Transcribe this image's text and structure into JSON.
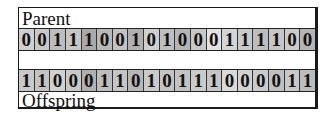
{
  "diagram": {
    "title_top": "Parent",
    "title_bottom": "Offspring",
    "parent": {
      "label": "Parent",
      "bits": [
        "0",
        "0",
        "1",
        "1",
        "1",
        "0",
        "0",
        "1",
        "0",
        "1",
        "0",
        "0",
        "0",
        "1",
        "1",
        "1",
        "1",
        "0",
        "0"
      ],
      "shades": [
        "#d0d0d0",
        "#c8c8c8",
        "#bdbdbd",
        "#c6c6c6",
        "#a9a9a9",
        "#b8b8b8",
        "#c2c2c2",
        "#b0b0b0",
        "#cfcfcf",
        "#bebebe",
        "#b5b5b5",
        "#c8c8c8",
        "#e2e2e2",
        "#d4d4d4",
        "#c9c9c9",
        "#bdbdbd",
        "#c6c6c6",
        "#cbcbcb",
        "#b4b4b4"
      ]
    },
    "offspring": {
      "label": "Offspring",
      "bits": [
        "1",
        "1",
        "0",
        "0",
        "0",
        "1",
        "1",
        "0",
        "1",
        "0",
        "1",
        "1",
        "1",
        "0",
        "0",
        "0",
        "0",
        "1",
        "1"
      ],
      "shades": [
        "#c9c9c9",
        "#c3c3c3",
        "#d0d0d0",
        "#c8c8c8",
        "#b0b0b0",
        "#bdbdbd",
        "#c5c5c5",
        "#b7b7b7",
        "#cacaca",
        "#c4c4c4",
        "#c2c2c2",
        "#cbcbcb",
        "#c6c6c6",
        "#dadada",
        "#d2d2d2",
        "#cbcbcb",
        "#c0c0c0",
        "#c8c8c8",
        "#bcbcbc"
      ]
    }
  }
}
